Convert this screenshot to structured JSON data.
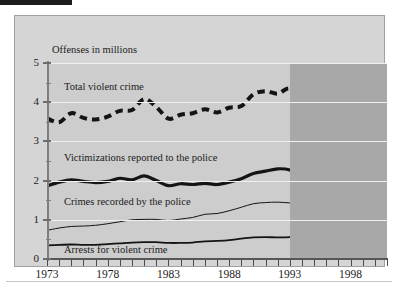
{
  "figure": {
    "axis_note": "Offenses in millions",
    "panel_color_light": "#cdcdcd",
    "panel_color_dark": "#a8a8a8",
    "frame_color": "#d5d5d5",
    "gridline_color": "#f0f0f0",
    "line_color": "#141414"
  },
  "chart_data": {
    "type": "line",
    "title": "",
    "subtitle": "",
    "xlabel": "",
    "ylabel": "Offenses in millions",
    "grid": true,
    "legend_position": "inline-labels",
    "xlim": [
      1973,
      2001
    ],
    "ylim": [
      0,
      5
    ],
    "ytick_labels": [
      "0",
      "1",
      "2",
      "3",
      "4",
      "5"
    ],
    "ytick_values": [
      0,
      1,
      2,
      3,
      4,
      5
    ],
    "yminor_step": 0.5,
    "xtick_labels": [
      "1973",
      "1978",
      "1983",
      "1988",
      "1993",
      "1998"
    ],
    "xtick_label_values": [
      1973,
      1978,
      1983,
      1988,
      1993,
      1998
    ],
    "xtick_step": 1,
    "shaded_region": {
      "from": 1993,
      "to": 2001,
      "label": ""
    },
    "x": [
      1973,
      1974,
      1975,
      1976,
      1977,
      1978,
      1979,
      1980,
      1981,
      1982,
      1983,
      1984,
      1985,
      1986,
      1987,
      1988,
      1989,
      1990,
      1991,
      1992,
      1993,
      1994,
      1995,
      1996,
      1997,
      1998,
      1999,
      2000,
      2001
    ],
    "series": [
      {
        "name": "Total violent crime",
        "style": "dashed",
        "width": 4,
        "values": [
          3.59,
          3.49,
          3.72,
          3.6,
          3.56,
          3.63,
          3.78,
          3.8,
          4.08,
          3.88,
          3.58,
          3.68,
          3.72,
          3.82,
          3.74,
          3.86,
          3.9,
          4.2,
          4.28,
          4.22,
          4.35,
          4.06,
          3.72,
          3.4,
          3.1,
          2.79,
          2.45,
          2.14,
          1.88
        ]
      },
      {
        "name": "Victimizations reported to the police",
        "style": "solid-thick",
        "width": 3.2,
        "values": [
          1.86,
          1.96,
          2.02,
          1.98,
          1.95,
          1.98,
          2.06,
          2.02,
          2.12,
          2.0,
          1.87,
          1.92,
          1.9,
          1.93,
          1.9,
          1.96,
          2.05,
          2.18,
          2.24,
          2.3,
          2.27,
          2.1,
          1.9,
          1.82,
          1.79,
          1.66,
          1.48,
          1.3,
          1.17
        ]
      },
      {
        "name": "Crimes recorded by the police",
        "style": "solid-thin",
        "width": 1,
        "values": [
          0.73,
          0.79,
          0.83,
          0.84,
          0.86,
          0.9,
          0.95,
          1.0,
          1.01,
          1.01,
          0.98,
          1.02,
          1.06,
          1.14,
          1.16,
          1.23,
          1.32,
          1.41,
          1.44,
          1.45,
          1.43,
          1.4,
          1.35,
          1.3,
          1.25,
          1.19,
          1.1,
          1.0,
          0.92
        ]
      },
      {
        "name": "Arrests for violent crime",
        "style": "solid-medium",
        "width": 1.8,
        "values": [
          0.35,
          0.36,
          0.37,
          0.36,
          0.36,
          0.38,
          0.4,
          0.42,
          0.43,
          0.43,
          0.41,
          0.41,
          0.42,
          0.45,
          0.46,
          0.48,
          0.52,
          0.55,
          0.56,
          0.55,
          0.56,
          0.58,
          0.56,
          0.53,
          0.51,
          0.49,
          0.47,
          0.46,
          0.46
        ]
      }
    ],
    "series_labels": [
      {
        "text": "Total violent crime",
        "x": 1974.4,
        "y": 4.4
      },
      {
        "text": "Victimizations reported to the police",
        "x": 1974.4,
        "y": 2.57
      },
      {
        "text": "Crimes recorded by the police",
        "x": 1974.4,
        "y": 1.45
      },
      {
        "text": "Arrests for violent crime",
        "x": 1974.4,
        "y": 0.22
      }
    ]
  }
}
